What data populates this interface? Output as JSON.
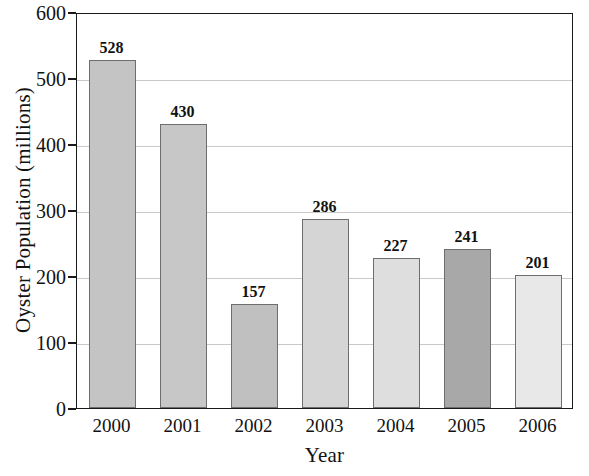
{
  "chart_data": {
    "type": "bar",
    "title": "",
    "xlabel": "Year",
    "ylabel": "Oyster Population (millions)",
    "categories": [
      "2000",
      "2001",
      "2002",
      "2003",
      "2004",
      "2005",
      "2006"
    ],
    "values": [
      528,
      430,
      157,
      286,
      227,
      241,
      201
    ],
    "value_labels": [
      "528",
      "430",
      "157",
      "286",
      "227",
      "241",
      "201"
    ],
    "bar_colors": [
      "#c4c4c4",
      "#c7c7c7",
      "#c0c0c0",
      "#d5d5d5",
      "#dedede",
      "#a8a8a8",
      "#e8e8e8"
    ],
    "bar_border_color": "#6e6e6e",
    "ylim": [
      0,
      600
    ],
    "ytick_values": [
      0,
      100,
      200,
      300,
      400,
      500,
      600
    ],
    "ytick_labels": [
      "0",
      "100",
      "200",
      "300",
      "400",
      "500",
      "600"
    ],
    "grid": true,
    "grid_color": "#c9c9c9",
    "legend": "none",
    "frame_color": "#1a1a1a",
    "background": "#ffffff"
  }
}
